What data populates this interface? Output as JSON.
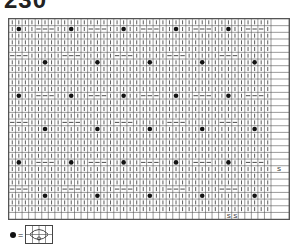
{
  "title": "230",
  "chart": {
    "cols": 40,
    "rows": 30,
    "cell_w": 6.55,
    "cell_h": 6.67,
    "extra_col_w": 18,
    "line_color": "#555555",
    "stitch_color": "#333333",
    "dot_color": "#111111",
    "symbols": {
      "knit": "|",
      "purl": "—",
      "bobble": "●",
      "slip": "S"
    },
    "pattern_repeat": {
      "cols": 16,
      "rows": 10
    }
  },
  "legend": {
    "symbol": "bobble-dot",
    "equals": "="
  }
}
